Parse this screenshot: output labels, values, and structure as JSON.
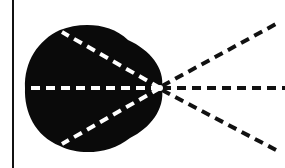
{
  "diagram": {
    "title": "",
    "background": "#ffffff",
    "axis_line": {
      "x": 13,
      "y1": 0,
      "y2": 168,
      "color": "#111111",
      "width": 2
    },
    "origin": {
      "x": 160,
      "y": 88
    },
    "lobe": {
      "fill": "#0a0a0a"
    },
    "rays_inside": [
      {
        "to_x": 25,
        "to_y": 88,
        "color": "#ffffff"
      },
      {
        "to_x": 62,
        "to_y": 32,
        "color": "#ffffff"
      },
      {
        "to_x": 62,
        "to_y": 144,
        "color": "#ffffff"
      }
    ],
    "rays_outside": [
      {
        "to_x": 285,
        "to_y": 88,
        "color": "#111111"
      },
      {
        "to_x": 276,
        "to_y": 24,
        "color": "#111111"
      },
      {
        "to_x": 276,
        "to_y": 150,
        "color": "#111111"
      }
    ],
    "dash": "9 6"
  }
}
